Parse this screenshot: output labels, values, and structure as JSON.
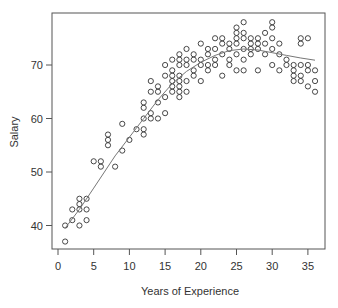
{
  "chart_data": {
    "type": "scatter",
    "title": "",
    "xlabel": "Years of Experience",
    "ylabel": "Salary",
    "xlim": [
      0,
      37
    ],
    "ylim": [
      36,
      79
    ],
    "xticks": [
      0,
      5,
      10,
      15,
      20,
      25,
      30,
      35
    ],
    "yticks": [
      40,
      50,
      60,
      70
    ],
    "grid": false,
    "legend": null,
    "colors": {
      "points": "#333333",
      "curve": "#777777",
      "frame": "#555555"
    },
    "points": [
      [
        1,
        40
      ],
      [
        1,
        37
      ],
      [
        2,
        41
      ],
      [
        2,
        43
      ],
      [
        3,
        45
      ],
      [
        3,
        44
      ],
      [
        3,
        43
      ],
      [
        3,
        40
      ],
      [
        4,
        45
      ],
      [
        4,
        43
      ],
      [
        4,
        41
      ],
      [
        5,
        52
      ],
      [
        6,
        52
      ],
      [
        6,
        51
      ],
      [
        7,
        55
      ],
      [
        7,
        56
      ],
      [
        7,
        57
      ],
      [
        8,
        51
      ],
      [
        9,
        59
      ],
      [
        9,
        54
      ],
      [
        10,
        56
      ],
      [
        11,
        58
      ],
      [
        12,
        57
      ],
      [
        12,
        58
      ],
      [
        12,
        60
      ],
      [
        12,
        62
      ],
      [
        12,
        63
      ],
      [
        13,
        61
      ],
      [
        13,
        60
      ],
      [
        13,
        65
      ],
      [
        13,
        67
      ],
      [
        14,
        60
      ],
      [
        14,
        63
      ],
      [
        14,
        65
      ],
      [
        14,
        66
      ],
      [
        15,
        64
      ],
      [
        15,
        68
      ],
      [
        15,
        70
      ],
      [
        15,
        61
      ],
      [
        16,
        65
      ],
      [
        16,
        66
      ],
      [
        16,
        67
      ],
      [
        16,
        68
      ],
      [
        16,
        69
      ],
      [
        16,
        71
      ],
      [
        17,
        64
      ],
      [
        17,
        65
      ],
      [
        17,
        66
      ],
      [
        17,
        67
      ],
      [
        17,
        68
      ],
      [
        17,
        70
      ],
      [
        17,
        71
      ],
      [
        17,
        72
      ],
      [
        18,
        65
      ],
      [
        18,
        67
      ],
      [
        18,
        70
      ],
      [
        18,
        71
      ],
      [
        18,
        73
      ],
      [
        19,
        68
      ],
      [
        19,
        69
      ],
      [
        19,
        71
      ],
      [
        19,
        72
      ],
      [
        20,
        67
      ],
      [
        20,
        70
      ],
      [
        20,
        71
      ],
      [
        20,
        74
      ],
      [
        21,
        69
      ],
      [
        21,
        70
      ],
      [
        21,
        72
      ],
      [
        21,
        73
      ],
      [
        22,
        70
      ],
      [
        22,
        71
      ],
      [
        22,
        73
      ],
      [
        22,
        75
      ],
      [
        23,
        68
      ],
      [
        23,
        72
      ],
      [
        23,
        74
      ],
      [
        23,
        75
      ],
      [
        24,
        70
      ],
      [
        24,
        71
      ],
      [
        24,
        73
      ],
      [
        24,
        74
      ],
      [
        25,
        69
      ],
      [
        25,
        72
      ],
      [
        25,
        74
      ],
      [
        25,
        75
      ],
      [
        25,
        76
      ],
      [
        25,
        77
      ],
      [
        26,
        69
      ],
      [
        26,
        71
      ],
      [
        26,
        73
      ],
      [
        26,
        75
      ],
      [
        26,
        76
      ],
      [
        26,
        78
      ],
      [
        27,
        72
      ],
      [
        27,
        73
      ],
      [
        27,
        74
      ],
      [
        27,
        75
      ],
      [
        28,
        69
      ],
      [
        28,
        73
      ],
      [
        28,
        74
      ],
      [
        28,
        75
      ],
      [
        29,
        72
      ],
      [
        29,
        74
      ],
      [
        29,
        76
      ],
      [
        30,
        70
      ],
      [
        30,
        73
      ],
      [
        30,
        75
      ],
      [
        30,
        77
      ],
      [
        30,
        78
      ],
      [
        31,
        69
      ],
      [
        31,
        72
      ],
      [
        31,
        74
      ],
      [
        32,
        70
      ],
      [
        32,
        71
      ],
      [
        33,
        67
      ],
      [
        33,
        68
      ],
      [
        33,
        69
      ],
      [
        33,
        70
      ],
      [
        34,
        67
      ],
      [
        34,
        68
      ],
      [
        34,
        70
      ],
      [
        34,
        74
      ],
      [
        34,
        75
      ],
      [
        35,
        66
      ],
      [
        35,
        69
      ],
      [
        35,
        70
      ],
      [
        35,
        75
      ],
      [
        36,
        65
      ],
      [
        36,
        67
      ],
      [
        36,
        69
      ]
    ],
    "curve": {
      "name": "smooth fit",
      "x": [
        1,
        3,
        5,
        8,
        10,
        12,
        14,
        16,
        18,
        20,
        22,
        24,
        26,
        28,
        30,
        32,
        34,
        36
      ],
      "y": [
        39.5,
        43,
        47,
        53,
        56.5,
        60,
        63.5,
        66.5,
        68.8,
        70.5,
        71.8,
        72.7,
        73.0,
        72.8,
        72.3,
        71.8,
        71.3,
        70.9
      ]
    }
  }
}
